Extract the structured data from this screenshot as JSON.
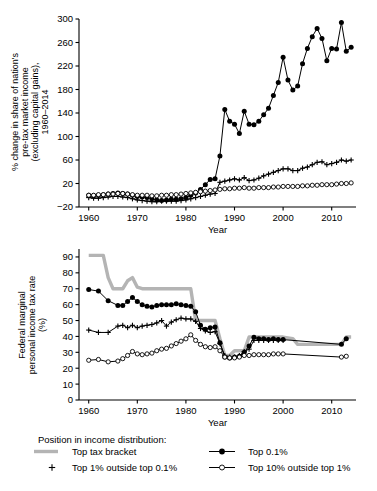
{
  "figure": {
    "ylabel_top": "% change in share of nation's pre-tax market income (excluding capital gains), 1960–2014",
    "ylabel_bottom": "Federal marginal personal income tax rate (%)"
  },
  "legend": {
    "title": "Position in income distribution:",
    "items": [
      {
        "label": "Top tax bracket",
        "marker": "thick-gray-line",
        "color": "#b4b4b4"
      },
      {
        "label": "Top 0.1%",
        "marker": "line-filled-circle",
        "color": "#000000"
      },
      {
        "label": "Top 1% outside top 0.1%",
        "marker": "plus",
        "color": "#000000"
      },
      {
        "label": "Top 10% outside top 1%",
        "marker": "line-open-circle",
        "color": "#000000"
      }
    ]
  },
  "chart_data": [
    {
      "type": "line",
      "id": "share-change",
      "title": "",
      "xlabel": "Year",
      "ylabel": "% change in share of nation's pre-tax market income (excluding capital gains), 1960–2014",
      "xlim": [
        1958,
        2015
      ],
      "ylim": [
        -20,
        300
      ],
      "yticks": [
        -20,
        20,
        60,
        100,
        140,
        180,
        220,
        260,
        300
      ],
      "xticks": [
        1960,
        1970,
        1980,
        1990,
        2000,
        2010
      ],
      "grid": false,
      "legend_position": "below-figure",
      "series": [
        {
          "name": "Top 0.1%",
          "marker": "filled-circle",
          "x": [
            1960,
            1961,
            1962,
            1963,
            1964,
            1965,
            1966,
            1967,
            1968,
            1969,
            1970,
            1971,
            1972,
            1973,
            1974,
            1975,
            1976,
            1977,
            1978,
            1979,
            1980,
            1981,
            1982,
            1983,
            1984,
            1985,
            1986,
            1987,
            1988,
            1989,
            1990,
            1991,
            1992,
            1993,
            1994,
            1995,
            1996,
            1997,
            1998,
            1999,
            2000,
            2001,
            2002,
            2003,
            2004,
            2005,
            2006,
            2007,
            2008,
            2009,
            2010,
            2011,
            2012,
            2013,
            2014
          ],
          "values": [
            0,
            -1,
            0,
            1,
            2,
            3,
            4,
            3,
            2,
            0,
            -2,
            -3,
            -4,
            -6,
            -8,
            -9,
            -8,
            -7,
            -7,
            -6,
            -4,
            0,
            4,
            10,
            18,
            27,
            28,
            67,
            146,
            126,
            121,
            105,
            143,
            121,
            120,
            126,
            137,
            148,
            170,
            192,
            235,
            196,
            179,
            186,
            224,
            250,
            270,
            284,
            267,
            229,
            250,
            249,
            294,
            245,
            252
          ]
        },
        {
          "name": "Top 1% outside top 0.1%",
          "marker": "plus",
          "x": [
            1960,
            1961,
            1962,
            1963,
            1964,
            1965,
            1966,
            1967,
            1968,
            1969,
            1970,
            1971,
            1972,
            1973,
            1974,
            1975,
            1976,
            1977,
            1978,
            1979,
            1980,
            1981,
            1982,
            1983,
            1984,
            1985,
            1986,
            1987,
            1988,
            1989,
            1990,
            1991,
            1992,
            1993,
            1994,
            1995,
            1996,
            1997,
            1998,
            1999,
            2000,
            2001,
            2002,
            2003,
            2004,
            2005,
            2006,
            2007,
            2008,
            2009,
            2010,
            2011,
            2012,
            2013,
            2014
          ],
          "values": [
            -4,
            -5,
            -5,
            -4,
            -3,
            -2,
            -2,
            -3,
            -4,
            -6,
            -8,
            -9,
            -10,
            -11,
            -11,
            -10,
            -10,
            -10,
            -10,
            -9,
            -8,
            -6,
            -4,
            -2,
            0,
            2,
            3,
            22,
            24,
            26,
            28,
            26,
            30,
            25,
            26,
            29,
            33,
            36,
            39,
            42,
            45,
            45,
            42,
            42,
            46,
            48,
            52,
            56,
            57,
            52,
            54,
            56,
            60,
            58,
            60
          ]
        },
        {
          "name": "Top 10% outside top 1%",
          "marker": "open-circle",
          "x": [
            1960,
            1961,
            1962,
            1963,
            1964,
            1965,
            1966,
            1967,
            1968,
            1969,
            1970,
            1971,
            1972,
            1973,
            1974,
            1975,
            1976,
            1977,
            1978,
            1979,
            1980,
            1981,
            1982,
            1983,
            1984,
            1985,
            1986,
            1987,
            1988,
            1989,
            1990,
            1991,
            1992,
            1993,
            1994,
            1995,
            1996,
            1997,
            1998,
            1999,
            2000,
            2001,
            2002,
            2003,
            2004,
            2005,
            2006,
            2007,
            2008,
            2009,
            2010,
            2011,
            2012,
            2013,
            2014
          ],
          "values": [
            0,
            0,
            1,
            1,
            2,
            2,
            3,
            3,
            2,
            1,
            0,
            0,
            0,
            -1,
            -1,
            0,
            0,
            1,
            1,
            2,
            3,
            4,
            5,
            6,
            7,
            8,
            9,
            10,
            11,
            11,
            12,
            12,
            13,
            12,
            12,
            13,
            13,
            13,
            14,
            14,
            15,
            15,
            15,
            15,
            16,
            16,
            17,
            17,
            18,
            18,
            18,
            19,
            20,
            20,
            21
          ]
        }
      ]
    },
    {
      "type": "line",
      "id": "marginal-tax-rate",
      "title": "",
      "xlabel": "Year",
      "ylabel": "Federal marginal personal income tax rate (%)",
      "xlim": [
        1958,
        2015
      ],
      "ylim": [
        0,
        95
      ],
      "yticks": [
        0,
        10,
        20,
        30,
        40,
        50,
        60,
        70,
        80,
        90
      ],
      "xticks": [
        1960,
        1970,
        1980,
        1990,
        2000,
        2010
      ],
      "grid": false,
      "legend_position": "below-figure",
      "series": [
        {
          "name": "Top tax bracket",
          "marker": "thick-gray-line",
          "color": "#b4b4b4",
          "x": [
            1960,
            1961,
            1962,
            1963,
            1964,
            1965,
            1966,
            1967,
            1968,
            1969,
            1970,
            1971,
            1972,
            1973,
            1974,
            1975,
            1976,
            1977,
            1978,
            1979,
            1980,
            1981,
            1982,
            1983,
            1984,
            1985,
            1986,
            1987,
            1988,
            1989,
            1990,
            1991,
            1992,
            1993,
            1994,
            1995,
            1996,
            1997,
            1998,
            1999,
            2000,
            2001,
            2002,
            2003,
            2004,
            2005,
            2006,
            2007,
            2008,
            2009,
            2010,
            2011,
            2012,
            2013,
            2014
          ],
          "values": [
            91,
            91,
            91,
            91,
            77,
            70,
            70,
            70,
            75,
            77,
            71,
            70,
            70,
            70,
            70,
            70,
            70,
            70,
            70,
            70,
            70,
            70,
            50,
            50,
            50,
            50,
            50,
            38.5,
            28,
            28,
            31,
            31,
            31,
            39.6,
            39.6,
            39.6,
            39.6,
            39.6,
            39.6,
            39.6,
            39.6,
            39.1,
            38.6,
            35,
            35,
            35,
            35,
            35,
            35,
            35,
            35,
            35,
            35,
            39.6,
            39.6
          ]
        },
        {
          "name": "Top 0.1%",
          "marker": "filled-circle",
          "x": [
            1960,
            1962,
            1964,
            1966,
            1967,
            1968,
            1969,
            1970,
            1971,
            1972,
            1973,
            1974,
            1975,
            1976,
            1977,
            1978,
            1979,
            1980,
            1981,
            1982,
            1983,
            1984,
            1985,
            1986,
            1987,
            1988,
            1989,
            1990,
            1991,
            1992,
            1993,
            1994,
            1995,
            1996,
            1997,
            1998,
            1999,
            2000,
            2012,
            2013
          ],
          "values": [
            69.5,
            68.5,
            62.5,
            59.5,
            59.5,
            62,
            64.5,
            62,
            60,
            59,
            58.5,
            59.5,
            60,
            60,
            60,
            60.5,
            60,
            59.5,
            59,
            55.5,
            47,
            44.5,
            45.5,
            46,
            36,
            27,
            26.5,
            27,
            27.5,
            30,
            34,
            39.5,
            38.5,
            38.5,
            38,
            38.5,
            38,
            38,
            35,
            38.5
          ]
        },
        {
          "name": "Top 1% outside top 0.1%",
          "marker": "plus",
          "x": [
            1960,
            1962,
            1964,
            1966,
            1967,
            1968,
            1969,
            1970,
            1971,
            1972,
            1973,
            1974,
            1975,
            1976,
            1977,
            1978,
            1979,
            1980,
            1981,
            1982,
            1983,
            1984,
            1985,
            1986,
            1987,
            1988,
            1989,
            1990,
            1991,
            1992,
            1993,
            1994,
            1995,
            1996,
            1997,
            1998,
            1999,
            2000
          ],
          "values": [
            44,
            42.5,
            42.5,
            46.5,
            47,
            45.5,
            47,
            45.5,
            46.5,
            47,
            47.5,
            48.5,
            50,
            46.5,
            49,
            50.5,
            51.5,
            51,
            51,
            49.5,
            45,
            43.5,
            42.5,
            43,
            35.5,
            28,
            27,
            27,
            28,
            30.5,
            32,
            37.5,
            37.5,
            37.5,
            37.5,
            37.5,
            37.5,
            37.5
          ]
        },
        {
          "name": "Top 10% outside top 1%",
          "marker": "open-circle",
          "x": [
            1960,
            1962,
            1964,
            1966,
            1967,
            1968,
            1969,
            1970,
            1971,
            1972,
            1973,
            1974,
            1975,
            1976,
            1977,
            1978,
            1979,
            1980,
            1981,
            1982,
            1983,
            1984,
            1985,
            1986,
            1987,
            1988,
            1989,
            1990,
            1991,
            1992,
            1993,
            1994,
            1995,
            1996,
            1997,
            1998,
            1999,
            2000,
            2012,
            2013
          ],
          "values": [
            25,
            25.5,
            24,
            24.5,
            26,
            28,
            30.5,
            29,
            28.5,
            29,
            29.5,
            31,
            32,
            32.5,
            34,
            35.5,
            37,
            38.5,
            41,
            37.5,
            35,
            33.5,
            33,
            33.5,
            31,
            27,
            26.5,
            26.5,
            27,
            28,
            28,
            28.5,
            28.5,
            28.5,
            28.5,
            29,
            29,
            29,
            27,
            27.5
          ]
        }
      ]
    }
  ]
}
